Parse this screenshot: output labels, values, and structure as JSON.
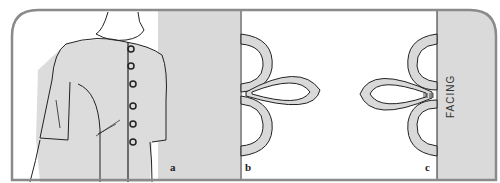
{
  "figure": {
    "panels": [
      {
        "id": "a",
        "label": "a",
        "description": "Dress front with button loops along center opening"
      },
      {
        "id": "b",
        "label": "b",
        "description": "Trefoil cord loop shape attached to edge"
      },
      {
        "id": "c",
        "label": "c",
        "description": "Trefoil cord loop stitched to facing"
      }
    ],
    "facing_label": "FACING"
  },
  "colors": {
    "panel_gray": "#d9d9d9",
    "border": "#8a8a8a",
    "line": "#222222",
    "background": "#ffffff"
  }
}
